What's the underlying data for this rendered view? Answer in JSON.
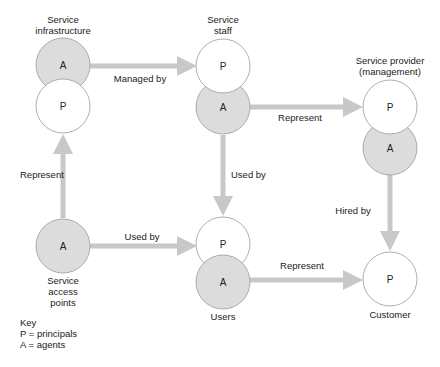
{
  "colors": {
    "agent_fill": "#dcdcdc",
    "principal_fill": "#ffffff",
    "stroke": "#9a9a9a",
    "arrow": "#c8c8c8",
    "text": "#222222"
  },
  "nodes": {
    "service_infrastructure": {
      "title_line1": "Service",
      "title_line2": "infrastructure",
      "top": "A",
      "bottom": "P"
    },
    "service_staff": {
      "title_line1": "Service",
      "title_line2": "staff",
      "top": "P",
      "bottom": "A"
    },
    "service_provider": {
      "title_line1": "Service provider",
      "title_line2": "(management)",
      "top": "P",
      "bottom": "A"
    },
    "service_access_points": {
      "title_line1": "Service",
      "title_line2": "access",
      "title_line3": "points",
      "circle": "A"
    },
    "users": {
      "title": "Users",
      "top": "P",
      "bottom": "A"
    },
    "customer": {
      "title": "Customer",
      "circle": "P"
    }
  },
  "edges": {
    "managed_by": "Managed by",
    "represent_staff_provider": "Represent",
    "used_by_staff_users": "Used by",
    "represent_access_infra": "Represent",
    "used_by_access_users": "Used by",
    "represent_users_customer": "Represent",
    "hired_by": "Hired by"
  },
  "key": {
    "title": "Key",
    "line1": "P = principals",
    "line2": "A = agents"
  }
}
